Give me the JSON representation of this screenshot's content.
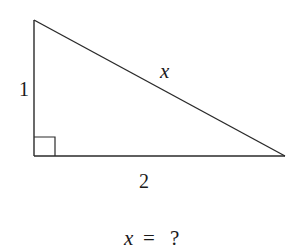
{
  "diagram": {
    "type": "right-triangle",
    "colors": {
      "stroke": "#2a2a2a",
      "text": "#1a1a1a",
      "background": "#ffffff"
    },
    "vertices": {
      "top": [
        34,
        20
      ],
      "bottom_left": [
        34,
        156
      ],
      "bottom_right": [
        285,
        156
      ]
    },
    "right_angle_marker": {
      "at": "bottom_left",
      "size": 21
    },
    "labels": {
      "vertical_leg": "1",
      "horizontal_leg": "2",
      "hypotenuse": "x"
    },
    "question": {
      "variable": "x",
      "equals": "=",
      "unknown": "?"
    }
  }
}
